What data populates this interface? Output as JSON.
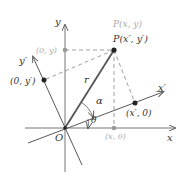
{
  "diagram": {
    "colors": {
      "axis": "#555555",
      "rotated_axis": "#444444",
      "radius": "#555555",
      "dashed": "#777777",
      "gray_label": "#aaaaaa",
      "gray_point": "#999999",
      "point": "#222222",
      "text": "#333333"
    },
    "labels": {
      "x_axis": "x",
      "y_axis": "y",
      "x_prime_axis": "x′",
      "y_prime_axis": "y′",
      "origin": "O",
      "radius": "r",
      "alpha": "α",
      "theta": "θ",
      "point_original": "P(x, y)",
      "point_rotated": "P(x′, y′)",
      "y_projection": "(0, y)",
      "x_projection": "(x, 0)",
      "y_prime_projection": "(0, y′)",
      "x_prime_projection": "(x′, 0)"
    }
  }
}
